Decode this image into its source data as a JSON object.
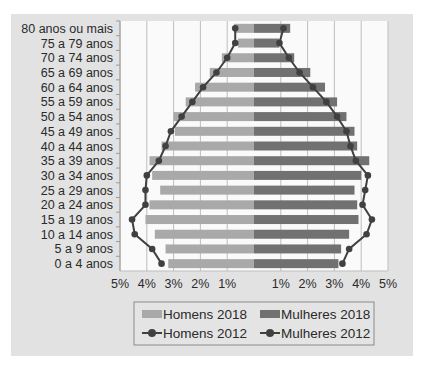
{
  "chart_data": {
    "type": "bar",
    "subtype": "population-pyramid",
    "title": "",
    "categories": [
      "80 anos ou mais",
      "75 a 79 anos",
      "70 a 74 anos",
      "65 a 69 anos",
      "60 a 64 anos",
      "55 a 59 anos",
      "50 a 54 anos",
      "45 a 49 anos",
      "40 a 44 anos",
      "35 a 39 anos",
      "30 a 34 anos",
      "25 a 29 anos",
      "20 a 24 anos",
      "15 a 19 anos",
      "10 a 14 anos",
      "5 a 9 anos",
      "0 a 4 anos"
    ],
    "series": [
      {
        "name": "Homens 2018",
        "kind": "bar",
        "side": "left",
        "color": "#a9a9a9",
        "values": [
          0.75,
          0.6,
          1.2,
          1.65,
          2.2,
          2.55,
          3.0,
          2.95,
          3.45,
          3.9,
          3.8,
          3.5,
          3.9,
          4.05,
          3.7,
          3.3,
          3.2
        ]
      },
      {
        "name": "Mulheres 2018",
        "kind": "bar",
        "side": "right",
        "color": "#717171",
        "values": [
          1.35,
          0.95,
          1.5,
          2.1,
          2.65,
          3.1,
          3.45,
          3.75,
          3.85,
          4.3,
          4.0,
          3.75,
          3.85,
          3.9,
          3.55,
          3.25,
          3.15
        ]
      },
      {
        "name": "Homens 2012",
        "kind": "line",
        "side": "left",
        "color": "#404040",
        "values": [
          0.7,
          0.7,
          1.0,
          1.4,
          1.9,
          2.3,
          2.7,
          3.1,
          3.3,
          3.55,
          4.0,
          4.05,
          4.05,
          4.55,
          4.45,
          3.8,
          3.45
        ]
      },
      {
        "name": "Mulheres 2012",
        "kind": "line",
        "side": "right",
        "color": "#404040",
        "values": [
          1.1,
          0.95,
          1.3,
          1.7,
          2.2,
          2.7,
          3.1,
          3.45,
          3.6,
          3.8,
          4.25,
          4.15,
          4.05,
          4.4,
          4.2,
          3.55,
          3.3
        ]
      }
    ],
    "xlabel": "",
    "ylabel": "",
    "xlim": [
      -5,
      5
    ],
    "x_ticks": [
      "5%",
      "4%",
      "3%",
      "2%",
      "1%",
      "",
      "1%",
      "2%",
      "3%",
      "4%",
      "5%"
    ],
    "grid": true,
    "legend_position": "bottom"
  },
  "legend": {
    "items": [
      {
        "label": "Homens 2018",
        "type": "bar",
        "color": "#a9a9a9"
      },
      {
        "label": "Mulheres 2018",
        "type": "bar",
        "color": "#717171"
      },
      {
        "label": "Homens 2012",
        "type": "line",
        "color": "#404040"
      },
      {
        "label": "Mulheres 2012",
        "type": "line",
        "color": "#404040"
      }
    ]
  },
  "colors": {
    "panel_bg": "#e2e2e2",
    "plot_bg": "#fafafa",
    "grid": "#bdbdbd",
    "text": "#2a2a2a"
  }
}
